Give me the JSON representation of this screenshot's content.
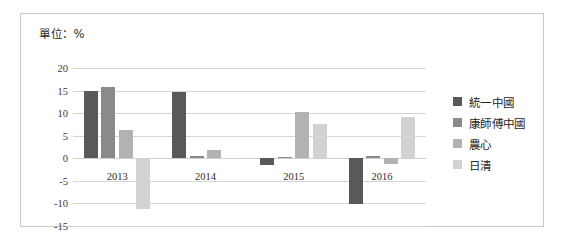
{
  "unit_label": "單位：%",
  "legend": {
    "position": "right",
    "items": [
      {
        "label": "統一中國",
        "color": "#595959"
      },
      {
        "label": "康師傅中國",
        "color": "#8a8a8a"
      },
      {
        "label": "農心",
        "color": "#b2b2b2"
      },
      {
        "label": "日清",
        "color": "#d2d2d2"
      }
    ]
  },
  "chart_data": {
    "type": "bar",
    "title": "單位：%",
    "xlabel": "",
    "ylabel": "",
    "ylim": [
      -15,
      20
    ],
    "yticks": [
      20,
      15,
      10,
      5,
      0,
      -5,
      -10,
      -15
    ],
    "ytick_labels": [
      "20",
      "15",
      "10",
      "5",
      "0",
      "-5",
      "-10",
      "-15"
    ],
    "grid": true,
    "categories": [
      "2013",
      "2014",
      "2015",
      "2016"
    ],
    "series": [
      {
        "name": "統一中國",
        "color": "#595959",
        "values": [
          15.0,
          14.7,
          -1.5,
          -10.1
        ]
      },
      {
        "name": "康師傅中國",
        "color": "#8a8a8a",
        "values": [
          15.7,
          0.4,
          0.3,
          0.4
        ]
      },
      {
        "name": "農心",
        "color": "#b2b2b2",
        "values": [
          6.2,
          1.9,
          10.3,
          -1.3
        ]
      },
      {
        "name": "日清",
        "color": "#d2d2d2",
        "values": [
          -11.2,
          0.1,
          7.6,
          9.1
        ]
      }
    ]
  }
}
